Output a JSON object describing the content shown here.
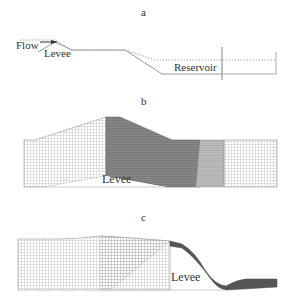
{
  "panels": [
    {
      "id": "a",
      "label": "a",
      "annotations": {
        "flow": "Flow",
        "levee": "Levee",
        "reservoir": "Reservoir"
      }
    },
    {
      "id": "b",
      "label": "b",
      "annotations": {
        "levee": "Levee"
      }
    },
    {
      "id": "c",
      "label": "c",
      "annotations": {
        "levee": "Levee"
      }
    }
  ],
  "colors": {
    "line": "#888888",
    "grid_light": "#9a9a9a",
    "grid_dark": "#555555",
    "ground": "#cccccc"
  }
}
